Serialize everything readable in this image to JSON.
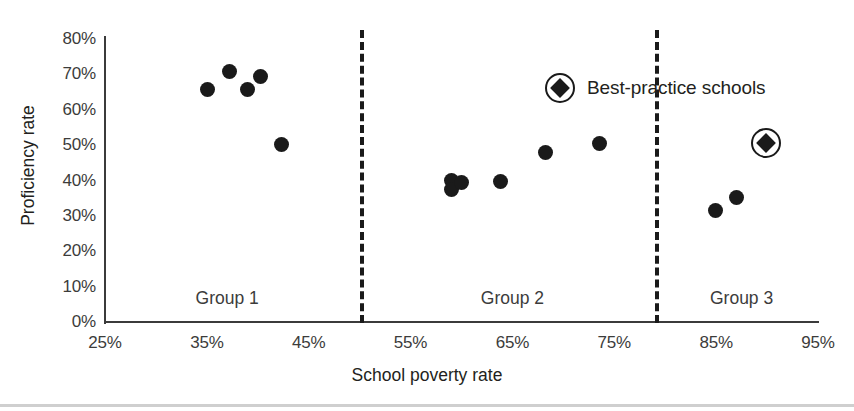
{
  "chart_data": {
    "type": "scatter",
    "title": "",
    "xlabel": "School poverty rate",
    "ylabel": "Proficiency rate",
    "xlim": [
      25,
      95
    ],
    "ylim": [
      0,
      80
    ],
    "xticks": [
      "25%",
      "35%",
      "45%",
      "55%",
      "65%",
      "75%",
      "85%",
      "95%"
    ],
    "xtick_values": [
      25,
      35,
      45,
      55,
      65,
      75,
      85,
      95
    ],
    "yticks": [
      "0%",
      "10%",
      "20%",
      "30%",
      "40%",
      "50%",
      "60%",
      "70%",
      "80%"
    ],
    "ytick_values": [
      0,
      10,
      20,
      30,
      40,
      50,
      60,
      70,
      80
    ],
    "grid": false,
    "legend_position": "inside-top-right",
    "legend": [
      {
        "label": "Best-practice schools",
        "marker": "circled-diamond"
      }
    ],
    "group_dividers": [
      50,
      79
    ],
    "group_labels": [
      {
        "label": "Group 1",
        "x": 37
      },
      {
        "label": "Group 2",
        "x": 65
      },
      {
        "label": "Group 3",
        "x": 87.5
      }
    ],
    "series": [
      {
        "name": "Schools",
        "marker": "circle",
        "points": [
          {
            "x": 35.1,
            "y": 65.8,
            "group": "Group 1"
          },
          {
            "x": 37.2,
            "y": 70.8,
            "group": "Group 1"
          },
          {
            "x": 39.0,
            "y": 65.8,
            "group": "Group 1"
          },
          {
            "x": 40.3,
            "y": 69.3,
            "group": "Group 1"
          },
          {
            "x": 42.3,
            "y": 50.2,
            "group": "Group 1"
          },
          {
            "x": 59.0,
            "y": 40.0,
            "group": "Group 2"
          },
          {
            "x": 59.0,
            "y": 37.5,
            "group": "Group 2"
          },
          {
            "x": 60.0,
            "y": 39.5,
            "group": "Group 2"
          },
          {
            "x": 63.8,
            "y": 39.7,
            "group": "Group 2"
          },
          {
            "x": 68.2,
            "y": 48.0,
            "group": "Group 2"
          },
          {
            "x": 73.5,
            "y": 50.4,
            "group": "Group 2"
          },
          {
            "x": 84.9,
            "y": 31.4,
            "group": "Group 3"
          },
          {
            "x": 87.0,
            "y": 35.3,
            "group": "Group 3"
          }
        ]
      },
      {
        "name": "Best-practice schools",
        "marker": "circled-diamond",
        "points": [
          {
            "x": 89.9,
            "y": 50.6,
            "group": "Group 3"
          }
        ]
      }
    ]
  },
  "axes": {
    "y_title": "Proficiency rate",
    "x_title": "School poverty rate"
  },
  "legend": {
    "best_practice_label": "Best-practice schools"
  },
  "groups": {
    "g1": "Group 1",
    "g2": "Group 2",
    "g3": "Group 3"
  },
  "colors": {
    "marker": "#1a1a1a",
    "axis": "#3b3b3b",
    "tick_text": "#3c3c3b",
    "title_text": "#231f20",
    "background": "#ffffff"
  }
}
